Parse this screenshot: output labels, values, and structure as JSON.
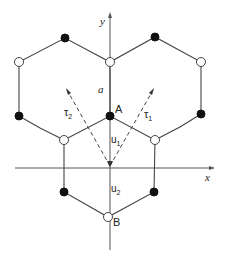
{
  "diagram": {
    "axes": {
      "x_label": "x",
      "y_label": "y"
    },
    "labels": {
      "a": "a",
      "A": "A",
      "B": "B",
      "u1": "u",
      "u1_sub": "1",
      "u2": "u",
      "u2_sub": "2",
      "tau1": "τ",
      "tau1_sub": "1",
      "tau2": "τ",
      "tau2_sub": "2"
    },
    "colors": {
      "filled_atom": "#111111",
      "open_atom": "#ffffff",
      "line": "#444444"
    },
    "atoms": [
      {
        "id": "top-left-black",
        "x": 65,
        "y": 38,
        "type": "filled"
      },
      {
        "id": "top-right-black",
        "x": 155,
        "y": 37,
        "type": "filled"
      },
      {
        "id": "left-white",
        "x": 19,
        "y": 62,
        "type": "open"
      },
      {
        "id": "center-white",
        "x": 110,
        "y": 62,
        "type": "open"
      },
      {
        "id": "right-white",
        "x": 201,
        "y": 62,
        "type": "open"
      },
      {
        "id": "left-black",
        "x": 19,
        "y": 116,
        "type": "filled"
      },
      {
        "id": "A",
        "x": 110,
        "y": 116,
        "type": "filled"
      },
      {
        "id": "right-black",
        "x": 201,
        "y": 114,
        "type": "filled"
      },
      {
        "id": "lower-left-white",
        "x": 64,
        "y": 140,
        "type": "open"
      },
      {
        "id": "lower-right-white",
        "x": 155,
        "y": 140,
        "type": "open"
      },
      {
        "id": "bottom-left-black",
        "x": 64,
        "y": 192,
        "type": "filled"
      },
      {
        "id": "bottom-right-black",
        "x": 154,
        "y": 192,
        "type": "filled"
      },
      {
        "id": "B",
        "x": 108,
        "y": 217,
        "type": "open"
      }
    ]
  }
}
